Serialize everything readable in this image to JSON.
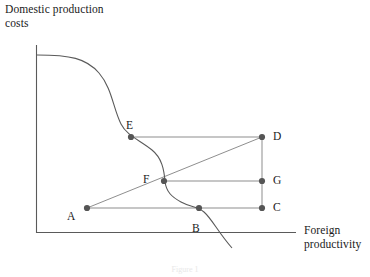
{
  "figure": {
    "type": "economics-diagram",
    "background": "#ffffff",
    "ink_color": "#4a4a4a",
    "text_color": "#1a1a1a",
    "axes": {
      "y_label": "Domestic production\ncosts",
      "x_label": "Foreign\nproductivity",
      "y_axis": {
        "x": 36,
        "y_top": 45,
        "y_bottom": 233
      },
      "x_axis": {
        "y": 233,
        "x_left": 36,
        "x_right": 296
      }
    },
    "curve": {
      "name": "cost-schedule-curve",
      "description": "downward sloping S-shaped domestic production cost schedule",
      "path": "M 37 55 C 70 55, 86 58, 99 73 C 112 88, 113 108, 121 124 C 127 136, 140 140, 152 150 C 162 158, 164 170, 165 181 C 166 192, 172 197, 181 202 C 190 207, 197 206, 204 212 C 212 219, 218 232, 232 248"
    },
    "connector_lines": [
      {
        "name": "line-E-D",
        "x1": 131,
        "y1": 137,
        "x2": 262,
        "y2": 137
      },
      {
        "name": "line-F-G",
        "x1": 164,
        "y1": 181,
        "x2": 262,
        "y2": 181
      },
      {
        "name": "line-A-C",
        "x1": 87,
        "y1": 208,
        "x2": 262,
        "y2": 208
      },
      {
        "name": "line-A-D-diagonal",
        "x1": 87,
        "y1": 208,
        "x2": 262,
        "y2": 137
      },
      {
        "name": "line-D-C-vertical",
        "x1": 262,
        "y1": 137,
        "x2": 262,
        "y2": 208
      }
    ],
    "points": [
      {
        "id": "E",
        "label": "E",
        "x": 131,
        "y": 137,
        "label_x": 126,
        "label_y": 119
      },
      {
        "id": "D",
        "label": "D",
        "x": 262,
        "y": 137,
        "label_x": 273,
        "label_y": 130
      },
      {
        "id": "F",
        "label": "F",
        "x": 164,
        "y": 181,
        "label_x": 143,
        "label_y": 173
      },
      {
        "id": "G",
        "label": "G",
        "x": 262,
        "y": 181,
        "label_x": 273,
        "label_y": 174
      },
      {
        "id": "A",
        "label": "A",
        "x": 87,
        "y": 208,
        "label_x": 67,
        "label_y": 210
      },
      {
        "id": "B",
        "label": "B",
        "x": 199,
        "y": 208,
        "label_x": 192,
        "label_y": 222
      },
      {
        "id": "C",
        "label": "C",
        "x": 262,
        "y": 208,
        "label_x": 273,
        "label_y": 201
      }
    ],
    "caption": "Figure 1"
  }
}
